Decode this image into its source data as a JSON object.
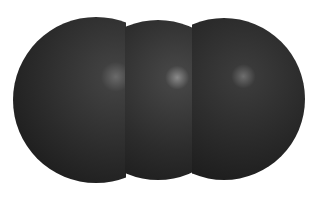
{
  "scene": {
    "description": "Three overlapping dark grey spheres in a row (space-filling molecular model)",
    "background": "#ffffff",
    "sphere_color": "#2e2e2e",
    "highlight_color": "#8a8a8a",
    "spheres": [
      {
        "name": "left-sphere",
        "cx": 96,
        "cy": 100,
        "r": 83,
        "highlight": {
          "x": 115,
          "y": 78
        }
      },
      {
        "name": "middle-sphere",
        "cx": 158,
        "cy": 100,
        "r": 80,
        "highlight": {
          "x": 178,
          "y": 78
        }
      },
      {
        "name": "right-sphere",
        "cx": 224,
        "cy": 99,
        "r": 81,
        "highlight": {
          "x": 245,
          "y": 78
        }
      }
    ]
  }
}
